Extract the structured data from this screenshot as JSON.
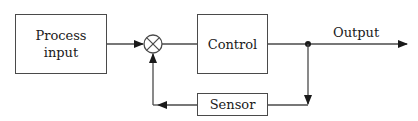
{
  "diagram": {
    "type": "feedback-control-block-diagram",
    "blocks": {
      "process_input": {
        "line1": "Process",
        "line2": "input"
      },
      "control": {
        "label": "Control"
      },
      "sensor": {
        "label": "Sensor"
      }
    },
    "summing_junction": {
      "symbol": "circle-with-x"
    },
    "output": {
      "label": "Output"
    },
    "colors": {
      "line": "#4a4a4a",
      "text": "#1a1a1a",
      "background": "#ffffff"
    }
  }
}
